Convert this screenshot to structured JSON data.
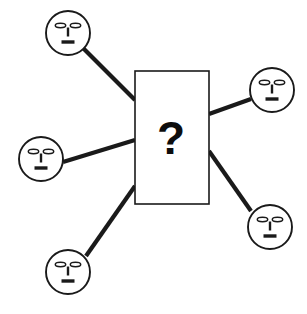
{
  "diagram": {
    "canvas": {
      "width": 307,
      "height": 314,
      "background": "#ffffff"
    },
    "line_color": "#1a1a1a",
    "stroke_color": "#1a1a1a",
    "fill_color": "#ffffff",
    "center_node": {
      "label": "?",
      "shape": "rectangle",
      "x": 135,
      "y": 71,
      "width": 74,
      "height": 133,
      "text_x": 171,
      "text_y": 138
    },
    "faces": [
      {
        "id": "face-top-left",
        "label": "face-top-left",
        "cx": 68,
        "cy": 33,
        "r": 22,
        "expression": "neutral"
      },
      {
        "id": "face-left",
        "label": "face-left",
        "cx": 41,
        "cy": 159,
        "r": 22,
        "expression": "neutral"
      },
      {
        "id": "face-bottom-left",
        "label": "face-bottom-left",
        "cx": 68,
        "cy": 272,
        "r": 22,
        "expression": "neutral"
      },
      {
        "id": "face-top-right",
        "label": "face-top-right",
        "cx": 272,
        "cy": 90,
        "r": 22,
        "expression": "neutral"
      },
      {
        "id": "face-bottom-right",
        "label": "face-bottom-right",
        "cx": 270,
        "cy": 227,
        "r": 22,
        "expression": "neutral"
      }
    ],
    "connectors": [
      {
        "id": "connector-top-left",
        "from": "face-top-left",
        "to": "center-node",
        "x1": 83,
        "y1": 48,
        "x2": 135,
        "y2": 100
      },
      {
        "id": "connector-left",
        "from": "face-left",
        "to": "center-node",
        "x1": 63,
        "y1": 162,
        "x2": 135,
        "y2": 140
      },
      {
        "id": "connector-bottom-left",
        "from": "face-bottom-left",
        "to": "center-node",
        "x1": 86,
        "y1": 256,
        "x2": 135,
        "y2": 186
      },
      {
        "id": "connector-top-right",
        "from": "center-node",
        "to": "face-top-right",
        "x1": 209,
        "y1": 114,
        "x2": 251,
        "y2": 99
      },
      {
        "id": "connector-bottom-right",
        "from": "center-node",
        "to": "face-bottom-right",
        "x1": 209,
        "y1": 151,
        "x2": 251,
        "y2": 211
      }
    ],
    "face_features": {
      "eye_rx": 5.2,
      "eye_ry": 2.2,
      "eye_offset_x": 7.5,
      "eye_offset_y": -7.5,
      "nose_width": 2.4,
      "nose_height": 9,
      "nose_offset_y": -1,
      "mouth_width": 13,
      "mouth_height": 3.4,
      "mouth_offset_y": 9
    }
  }
}
